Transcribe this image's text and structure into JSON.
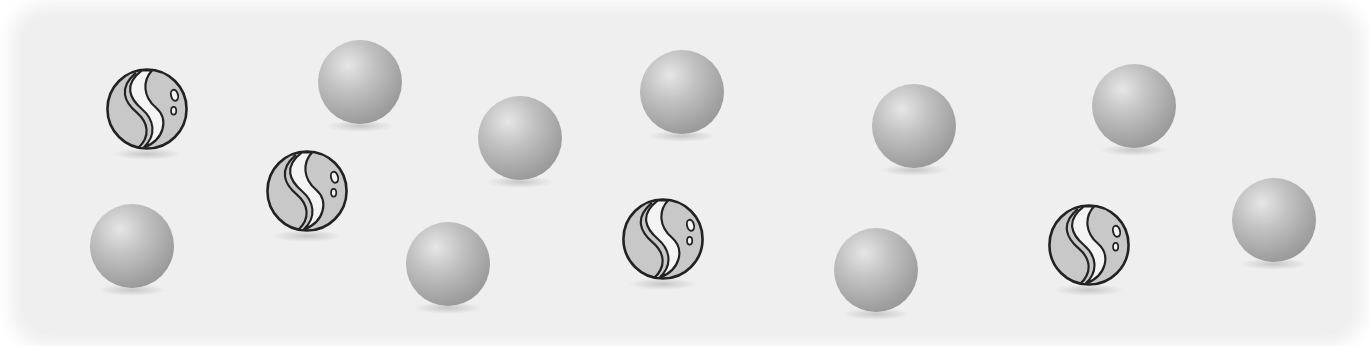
{
  "scene": {
    "description": "Marbles: swirled marbles mixed with plain gray balls",
    "background_color": "#efefef",
    "counts": {
      "swirled_marbles": 4,
      "plain_balls": 10,
      "total": 14
    }
  },
  "swirled_marbles": [
    {
      "x": 104,
      "y": 66,
      "size": 86
    },
    {
      "x": 264,
      "y": 148,
      "size": 86
    },
    {
      "x": 620,
      "y": 196,
      "size": 86
    },
    {
      "x": 1046,
      "y": 202,
      "size": 86
    }
  ],
  "plain_balls": [
    {
      "x": 318,
      "y": 40,
      "size": 84
    },
    {
      "x": 478,
      "y": 96,
      "size": 84
    },
    {
      "x": 640,
      "y": 50,
      "size": 84
    },
    {
      "x": 872,
      "y": 84,
      "size": 84
    },
    {
      "x": 1092,
      "y": 64,
      "size": 84
    },
    {
      "x": 90,
      "y": 204,
      "size": 84
    },
    {
      "x": 406,
      "y": 222,
      "size": 84
    },
    {
      "x": 834,
      "y": 228,
      "size": 84
    },
    {
      "x": 1232,
      "y": 178,
      "size": 84
    }
  ],
  "colors": {
    "ball_dark": "#8a8a8a",
    "ball_light": "#e6e6e6",
    "outline": "#222222",
    "swirl_fill": "#f4f4f4",
    "marble_fill": "#c8c8c8"
  }
}
